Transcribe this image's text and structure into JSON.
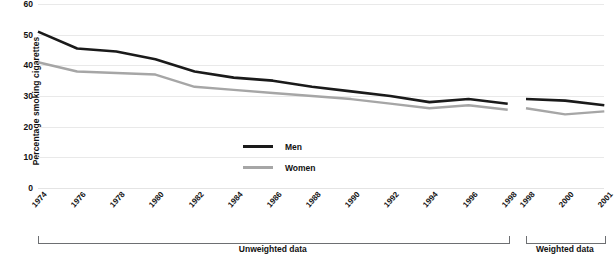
{
  "chart_data": {
    "type": "line",
    "title": "",
    "xlabel": "",
    "ylabel": "Percentage smoking cigarettes",
    "ylim": [
      0,
      60
    ],
    "yticks": [
      0,
      10,
      20,
      30,
      40,
      50,
      60
    ],
    "grid": true,
    "legend_position": "center",
    "panels": [
      {
        "name": "unweighted",
        "caption": "Unweighted data",
        "categories": [
          "1974",
          "1976",
          "1978",
          "1980",
          "1982",
          "1984",
          "1986",
          "1988",
          "1990",
          "1992",
          "1994",
          "1996",
          "1998"
        ],
        "series": [
          {
            "name": "Men",
            "values": [
              51,
              45.5,
              44.5,
              42,
              38,
              36,
              35,
              33,
              31.5,
              30,
              28,
              29,
              27.5
            ]
          },
          {
            "name": "Women",
            "values": [
              41,
              38,
              37.5,
              37,
              33,
              32,
              31,
              30,
              29,
              27.5,
              26,
              27,
              25.5
            ]
          }
        ]
      },
      {
        "name": "weighted",
        "caption": "Weighted data",
        "categories": [
          "1998",
          "2000",
          "2001"
        ],
        "series": [
          {
            "name": "Men",
            "values": [
              29,
              28.5,
              27
            ]
          },
          {
            "name": "Women",
            "values": [
              26,
              24,
              25
            ]
          }
        ]
      }
    ],
    "legend": [
      {
        "label": "Men",
        "color": "#1a1a1a"
      },
      {
        "label": "Women",
        "color": "#a6a6a6"
      }
    ]
  },
  "colors": {
    "men": "#1a1a1a",
    "women": "#a6a6a6",
    "grid": "#e9e9e9",
    "bracket": "#6d6f72",
    "text": "#111111",
    "background": "#ffffff"
  }
}
